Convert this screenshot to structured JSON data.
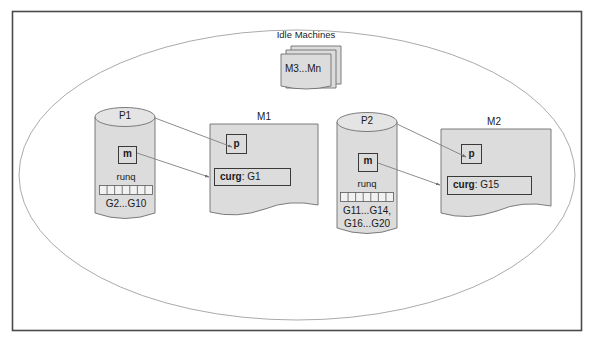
{
  "figure": {
    "outer_frame": {
      "stroke": "#4a4a4a"
    },
    "universe": {
      "label": "",
      "stroke": "#9a9a9a"
    },
    "fill_color": "#dcdcdc",
    "shape_stroke": "#6e6e6e",
    "arrow_color": "#808080",
    "text_color": "#1a1a1a"
  },
  "idle": {
    "title": "Idle Machines",
    "card_label": "M3...Mn"
  },
  "processors": [
    {
      "name": "P1",
      "machine_box_label": "m",
      "runq_label": "runq",
      "runq_cells": 7,
      "queue_contents": [
        "G2...G10"
      ]
    },
    {
      "name": "P2",
      "machine_box_label": "m",
      "runq_label": "runq",
      "runq_cells": 7,
      "queue_contents": [
        "G11...G14,",
        "G16...G20"
      ]
    }
  ],
  "machines": [
    {
      "name": "M1",
      "p_box_label": "p",
      "curg_key": "curg",
      "curg_sep": ": ",
      "curg_value": "G1"
    },
    {
      "name": "M2",
      "p_box_label": "p",
      "curg_key": "curg",
      "curg_sep": ": ",
      "curg_value": "G15"
    }
  ]
}
